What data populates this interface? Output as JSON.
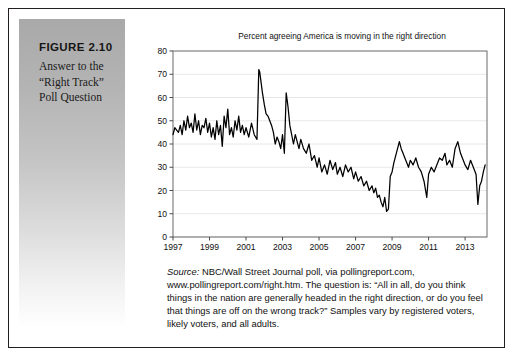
{
  "figure": {
    "number": "FIGURE 2.10",
    "caption_lines": [
      "Answer to the",
      "“Right Track”",
      "Poll Question"
    ]
  },
  "source": {
    "lead": "Source:",
    "text": " NBC/Wall Street Journal poll, via pollingreport.com, www.pollingreport.com/right.htm. The question is: “All in all, do you think things in the nation are generally headed in the right direction, or do you feel that things are off on the wrong track?” Samples vary by registered voters, likely voters, and all adults."
  },
  "chart_data": {
    "type": "line",
    "title": "Percent agreeing America is moving in the right direction",
    "xlabel": "",
    "ylabel": "",
    "xlim": [
      1997,
      2014.2
    ],
    "ylim": [
      0,
      80
    ],
    "yticks": [
      0,
      10,
      20,
      30,
      40,
      50,
      60,
      70,
      80
    ],
    "xticks": [
      1997,
      1999,
      2001,
      2003,
      2005,
      2007,
      2009,
      2011,
      2013
    ],
    "grid": "horizontal",
    "legend": "none",
    "line_color": "#000000",
    "series": [
      {
        "name": "Percent right direction",
        "x": [
          1997.0,
          1997.1,
          1997.2,
          1997.3,
          1997.4,
          1997.5,
          1997.6,
          1997.7,
          1997.8,
          1997.9,
          1998.0,
          1998.1,
          1998.2,
          1998.3,
          1998.4,
          1998.5,
          1998.6,
          1998.7,
          1998.8,
          1998.9,
          1999.0,
          1999.1,
          1999.2,
          1999.3,
          1999.4,
          1999.5,
          1999.6,
          1999.7,
          1999.8,
          1999.9,
          2000.0,
          2000.1,
          2000.2,
          2000.3,
          2000.4,
          2000.5,
          2000.6,
          2000.7,
          2000.8,
          2000.9,
          2001.0,
          2001.15,
          2001.3,
          2001.45,
          2001.6,
          2001.7,
          2001.75,
          2001.8,
          2001.9,
          2002.0,
          2002.1,
          2002.2,
          2002.3,
          2002.4,
          2002.5,
          2002.6,
          2002.7,
          2002.8,
          2002.9,
          2003.0,
          2003.1,
          2003.2,
          2003.3,
          2003.4,
          2003.5,
          2003.6,
          2003.7,
          2003.8,
          2003.9,
          2004.0,
          2004.15,
          2004.3,
          2004.45,
          2004.6,
          2004.75,
          2004.9,
          2005.0,
          2005.15,
          2005.3,
          2005.45,
          2005.6,
          2005.75,
          2005.9,
          2006.0,
          2006.15,
          2006.3,
          2006.45,
          2006.6,
          2006.75,
          2006.9,
          2007.0,
          2007.15,
          2007.3,
          2007.45,
          2007.6,
          2007.75,
          2007.9,
          2008.0,
          2008.1,
          2008.2,
          2008.3,
          2008.4,
          2008.5,
          2008.6,
          2008.7,
          2008.8,
          2008.9,
          2009.0,
          2009.1,
          2009.2,
          2009.3,
          2009.4,
          2009.5,
          2009.6,
          2009.7,
          2009.8,
          2009.9,
          2010.0,
          2010.15,
          2010.3,
          2010.45,
          2010.6,
          2010.75,
          2010.9,
          2011.0,
          2011.15,
          2011.3,
          2011.45,
          2011.6,
          2011.75,
          2011.9,
          2012.0,
          2012.15,
          2012.3,
          2012.45,
          2012.6,
          2012.75,
          2012.9,
          2013.0,
          2013.15,
          2013.3,
          2013.45,
          2013.6,
          2013.7,
          2013.8,
          2013.9,
          2014.0,
          2014.1
        ],
        "values": [
          44,
          47,
          46,
          45,
          48,
          44,
          50,
          46,
          52,
          47,
          49,
          45,
          53,
          46,
          50,
          44,
          48,
          47,
          51,
          45,
          49,
          43,
          47,
          42,
          50,
          44,
          48,
          39,
          52,
          47,
          55,
          44,
          47,
          43,
          50,
          46,
          52,
          45,
          48,
          44,
          47,
          43,
          49,
          44,
          42,
          72,
          71,
          68,
          62,
          57,
          53,
          52,
          50,
          48,
          45,
          40,
          43,
          41,
          38,
          44,
          36,
          62,
          56,
          48,
          44,
          40,
          44,
          41,
          38,
          42,
          38,
          36,
          40,
          33,
          35,
          30,
          34,
          28,
          31,
          27,
          33,
          29,
          32,
          27,
          30,
          26,
          31,
          28,
          30,
          25,
          28,
          24,
          26,
          22,
          24,
          20,
          22,
          19,
          21,
          17,
          18,
          15,
          13,
          17,
          11,
          12,
          26,
          28,
          32,
          35,
          38,
          41,
          38,
          36,
          34,
          32,
          30,
          33,
          31,
          34,
          30,
          28,
          24,
          17,
          27,
          30,
          28,
          31,
          34,
          33,
          36,
          31,
          33,
          30,
          38,
          41,
          36,
          33,
          31,
          29,
          33,
          30,
          27,
          14,
          22,
          24,
          28,
          31
        ]
      }
    ],
    "annotations": [
      {
        "label": "post-9/11 peak",
        "x": 2001.7,
        "y": 72
      },
      {
        "label": "2008 trough",
        "x": 2008.7,
        "y": 11
      },
      {
        "label": "2013 shutdown dip",
        "x": 2013.7,
        "y": 14
      }
    ]
  }
}
